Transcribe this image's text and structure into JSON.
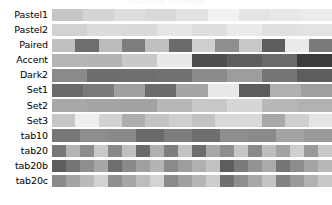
{
  "figure": {
    "title": "Qualitative colormaps",
    "background_color": "#ffffff",
    "label_color": "#000000",
    "rendering": "grayscale"
  },
  "chart_data": {
    "type": "heatmap",
    "title": "Qualitative colormaps",
    "xlabel": "",
    "ylabel": "",
    "grid": false,
    "legend": "none",
    "categories": [
      "Pastel1",
      "Pastel2",
      "Paired",
      "Accent",
      "Dark2",
      "Set1",
      "Set2",
      "Set3",
      "tab10",
      "tab20",
      "tab20b",
      "tab20c"
    ],
    "rows": [
      {
        "name": "Pastel1",
        "n_colors": 9,
        "values": [
          "#c6c6c6",
          "#d4d4d4",
          "#dedede",
          "#d8d8d8",
          "#e2e2e2",
          "#f2f2f2",
          "#e4e4e4",
          "#e8e8e8",
          "#ececec"
        ]
      },
      {
        "name": "Pastel2",
        "n_colors": 8,
        "values": [
          "#d2d2d2",
          "#dcdcdc",
          "#dadada",
          "#e6e6e6",
          "#dedede",
          "#eaeaea",
          "#e0e0e0",
          "#e3e3e3"
        ]
      },
      {
        "name": "Paired",
        "n_colors": 12,
        "values": [
          "#c0c0c0",
          "#6e6e6e",
          "#bcbcbc",
          "#7d7d7d",
          "#bfbfbf",
          "#6a6a6a",
          "#cfcfcf",
          "#8f8f8f",
          "#c8c8c8",
          "#5d5d5d",
          "#eaeaea",
          "#7a7a7a"
        ]
      },
      {
        "name": "Accent",
        "n_colors": 8,
        "values": [
          "#b6b6b6",
          "#b4b4b4",
          "#c9c9c9",
          "#e8e8e8",
          "#4e4e4e",
          "#5e5e5e",
          "#6a6a6a",
          "#3b3b3b"
        ]
      },
      {
        "name": "Dark2",
        "n_colors": 8,
        "values": [
          "#8a8a8a",
          "#6d6d6d",
          "#6f6f6f",
          "#717171",
          "#8b8b8b",
          "#9d9d9d",
          "#767676",
          "#5e5e5e"
        ]
      },
      {
        "name": "Set1",
        "n_colors": 9,
        "values": [
          "#6a6a6a",
          "#7a7a7a",
          "#a0a0a0",
          "#6b6b6b",
          "#a4a4a4",
          "#e8e8e8",
          "#5d5d5d",
          "#b0b0b0",
          "#9f9f9f"
        ]
      },
      {
        "name": "Set2",
        "n_colors": 8,
        "values": [
          "#a8a8a8",
          "#a4a4a4",
          "#a2a2a2",
          "#b7b7b7",
          "#c8c8c8",
          "#d6d6d6",
          "#b8b8b8",
          "#b2b2b2"
        ]
      },
      {
        "name": "Set3",
        "n_colors": 12,
        "values": [
          "#c6c6c6",
          "#eeeeee",
          "#d2d2d2",
          "#aeaeae",
          "#c4c4c4",
          "#cfcfcf",
          "#c2c2c2",
          "#d8d8d8",
          "#d9d9d9",
          "#a9a9a9",
          "#cfcfcf",
          "#e4e4e4"
        ]
      },
      {
        "name": "tab10",
        "n_colors": 10,
        "values": [
          "#777777",
          "#8d8d8d",
          "#898989",
          "#6a6a6a",
          "#7d7d7d",
          "#6e6e6e",
          "#8e8e8e",
          "#8a8a8a",
          "#a3a3a3",
          "#999999"
        ]
      },
      {
        "name": "tab20",
        "n_colors": 20,
        "values": [
          "#777777",
          "#b4b4b4",
          "#8d8d8d",
          "#c9c9c9",
          "#898989",
          "#c0c0c0",
          "#6a6a6a",
          "#b0b0b0",
          "#7d7d7d",
          "#c3c3c3",
          "#6e6e6e",
          "#a8a8a8",
          "#8e8e8e",
          "#c6c6c6",
          "#8a8a8a",
          "#bdbdbd",
          "#a3a3a3",
          "#cfcfcf",
          "#999999",
          "#c8c8c8"
        ]
      },
      {
        "name": "tab20b",
        "n_colors": 20,
        "values": [
          "#5e5e5e",
          "#757575",
          "#8e8e8e",
          "#a6a6a6",
          "#6e6e6e",
          "#898989",
          "#a0a0a0",
          "#b4b4b4",
          "#8a8a8a",
          "#9d9d9d",
          "#b0b0b0",
          "#c2c2c2",
          "#5d5d5d",
          "#7a7a7a",
          "#949494",
          "#aaaaaa",
          "#757575",
          "#8d8d8d",
          "#a4a4a4",
          "#b8b8b8"
        ]
      },
      {
        "name": "tab20c",
        "n_colors": 20,
        "values": [
          "#8b8b8b",
          "#a4a4a4",
          "#bababa",
          "#d2d2d2",
          "#8f8f8f",
          "#a6a6a6",
          "#bdbdbd",
          "#d4d4d4",
          "#8a8a8a",
          "#a0a0a0",
          "#b6b6b6",
          "#cccccc",
          "#707070",
          "#8e8e8e",
          "#a8a8a8",
          "#c4c4c4",
          "#828282",
          "#9a9a9a",
          "#b2b2b2",
          "#c9c9c9"
        ]
      }
    ]
  }
}
